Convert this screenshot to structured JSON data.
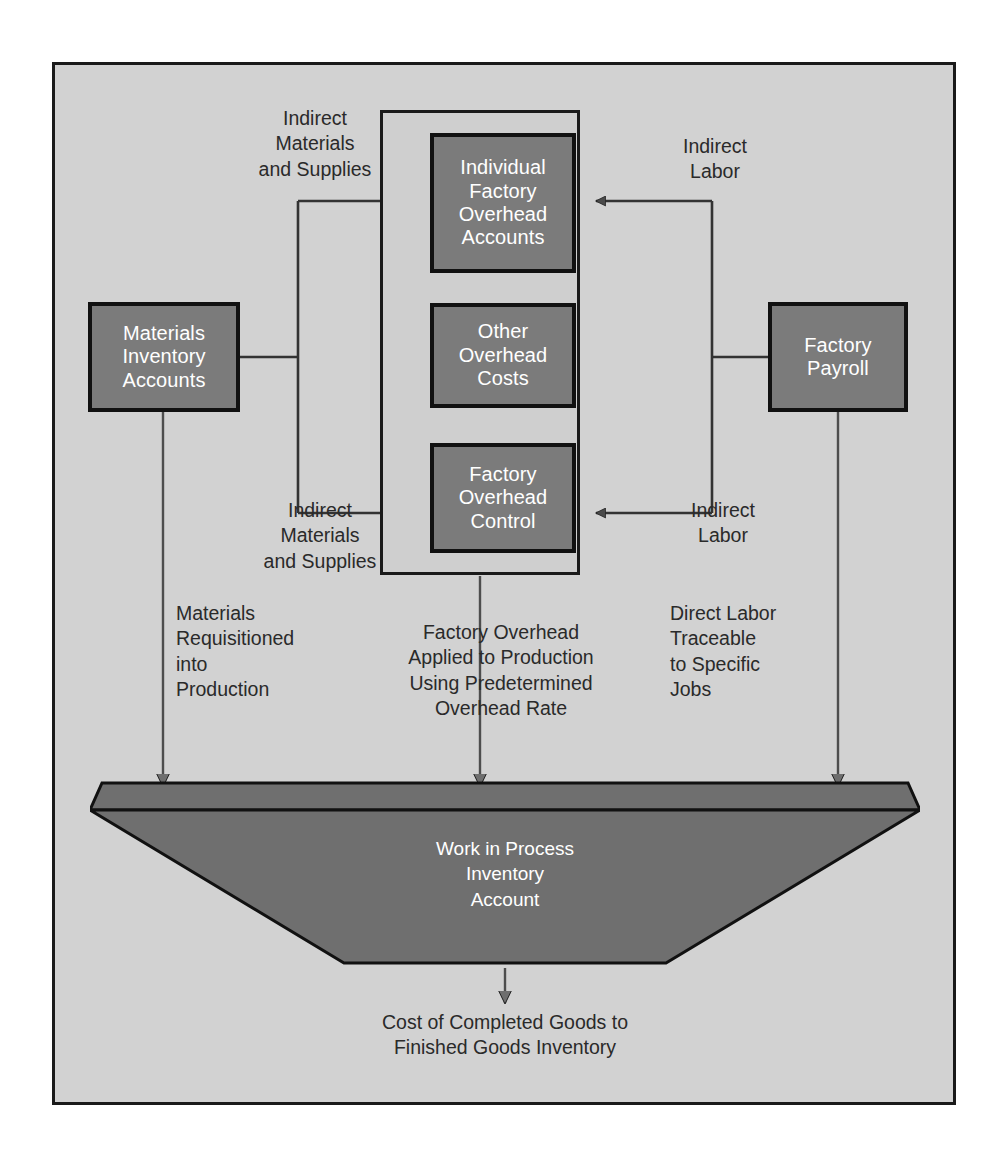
{
  "diagram": {
    "colors": {
      "page_background": "#ffffff",
      "frame_background": "#d2d2d2",
      "inner_group_background": "#cfcfcf",
      "node_fill": "#7b7b7b",
      "node_border": "#111111",
      "node_text": "#ffffff",
      "caption_text": "#2a2a2a",
      "connector": "#333333"
    }
  },
  "nodes": {
    "individual_factory_overhead_accounts": "Individual\nFactory\nOverhead\nAccounts",
    "other_overhead_costs": "Other\nOverhead\nCosts",
    "factory_overhead_control": "Factory\nOverhead\nControl",
    "materials_inventory_accounts": "Materials\nInventory\nAccounts",
    "factory_payroll": "Factory\nPayroll",
    "work_in_process": "Work in Process\nInventory\nAccount"
  },
  "captions": {
    "indirect_materials_top": "Indirect\nMaterials\nand Supplies",
    "indirect_labor_top": "Indirect\nLabor",
    "indirect_materials_bottom": "Indirect\nMaterials\nand Supplies",
    "indirect_labor_bottom": "Indirect\nLabor",
    "materials_requisitioned": "Materials\nRequisitioned\ninto\nProduction",
    "factory_overhead_applied": "Factory Overhead\nApplied to Production\nUsing Predetermined\nOverhead Rate",
    "direct_labor": "Direct Labor\nTraceable\nto Specific\nJobs",
    "cost_of_completed_goods": "Cost of Completed Goods to\nFinished Goods Inventory"
  },
  "flows": [
    {
      "from": "materials_inventory_accounts",
      "to": "individual_factory_overhead_accounts",
      "label": "Indirect Materials and Supplies"
    },
    {
      "from": "materials_inventory_accounts",
      "to": "factory_overhead_control",
      "label": "Indirect Materials and Supplies"
    },
    {
      "from": "factory_payroll",
      "to": "individual_factory_overhead_accounts",
      "label": "Indirect Labor"
    },
    {
      "from": "factory_payroll",
      "to": "factory_overhead_control",
      "label": "Indirect Labor"
    },
    {
      "from": "other_overhead_costs",
      "to": "individual_factory_overhead_accounts",
      "label": ""
    },
    {
      "from": "other_overhead_costs",
      "to": "factory_overhead_control",
      "label": ""
    },
    {
      "from": "materials_inventory_accounts",
      "to": "work_in_process",
      "label": "Materials Requisitioned into Production"
    },
    {
      "from": "factory_overhead_control",
      "to": "work_in_process",
      "label": "Factory Overhead Applied to Production Using Predetermined Overhead Rate"
    },
    {
      "from": "factory_payroll",
      "to": "work_in_process",
      "label": "Direct Labor Traceable to Specific Jobs"
    },
    {
      "from": "work_in_process",
      "to": "finished_goods_inventory",
      "label": "Cost of Completed Goods to Finished Goods Inventory"
    }
  ]
}
